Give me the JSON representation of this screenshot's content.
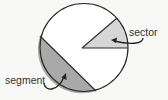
{
  "diagram": {
    "type": "circle-parts",
    "canvas": {
      "width": 168,
      "height": 100,
      "background": "#f8f8f6"
    },
    "circle": {
      "cx": 84,
      "cy": 47.5,
      "r": 44,
      "stroke": "#2a2a2a",
      "fill": "#ffffff"
    },
    "sector": {
      "label": "sector",
      "fill": "#d6d6d6",
      "apex": [
        82,
        48
      ],
      "arc_start": [
        117,
        18
      ],
      "arc_end": [
        128,
        48
      ]
    },
    "segment": {
      "label": "segment",
      "fill": "#a9a9a9",
      "chord_start": [
        40,
        36
      ],
      "chord_end": [
        96,
        91
      ]
    },
    "labels": [
      {
        "id": "sector",
        "text": "sector",
        "x": 129,
        "y": 36
      },
      {
        "id": "segment",
        "text": "segment",
        "x": 5,
        "y": 84
      }
    ],
    "colors": {
      "outline": "#2a2a2a",
      "text": "#333333",
      "sector_fill": "#d6d6d6",
      "segment_fill": "#a9a9a9"
    }
  }
}
